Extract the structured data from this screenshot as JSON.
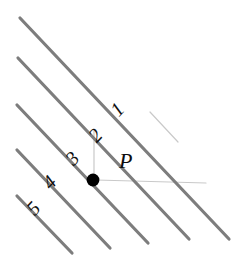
{
  "figure": {
    "background_color": "#ffffff",
    "width": 246,
    "height": 273
  },
  "style": {
    "line_color": "#7d7d7d",
    "line_width": 3.2,
    "faint_line_color": "#c9c9c9",
    "faint_line_width": 1.2,
    "point_color": "#000000",
    "label_color": "#111111"
  },
  "point": {
    "label": "P",
    "label_x": 119,
    "label_y": 150,
    "label_size": 22,
    "dot_cx": 93,
    "dot_cy": 180,
    "dot_r": 6.4
  },
  "lines": [
    {
      "label": "1",
      "x1": 20,
      "y1": 18,
      "x2": 229,
      "y2": 239,
      "label_x": 112,
      "label_y": 99,
      "label_size": 20,
      "label_rotation": -47
    },
    {
      "label": "2",
      "x1": 18,
      "y1": 58,
      "x2": 189,
      "y2": 239,
      "label_x": 90,
      "label_y": 125,
      "label_size": 20,
      "label_rotation": -47
    },
    {
      "label": "3",
      "x1": 17,
      "y1": 105,
      "x2": 148,
      "y2": 243,
      "label_x": 67,
      "label_y": 148,
      "label_size": 20,
      "label_rotation": -47
    },
    {
      "label": "4",
      "x1": 17,
      "y1": 150,
      "x2": 110,
      "y2": 248,
      "label_x": 44,
      "label_y": 172,
      "label_size": 20,
      "label_rotation": -47
    },
    {
      "label": "5",
      "x1": 17,
      "y1": 196,
      "x2": 72,
      "y2": 253,
      "label_x": 28,
      "label_y": 198,
      "label_size": 20,
      "label_rotation": -47
    }
  ],
  "construction_lines": [
    {
      "name": "horizontal-ray-from-p",
      "x1": 96,
      "y1": 180,
      "x2": 206,
      "y2": 183
    },
    {
      "name": "vertical-ray-above-p",
      "x1": 94,
      "y1": 131,
      "x2": 94,
      "y2": 178
    },
    {
      "name": "diagonal-hint-upper-right",
      "x1": 150,
      "y1": 112,
      "x2": 178,
      "y2": 142
    }
  ]
}
